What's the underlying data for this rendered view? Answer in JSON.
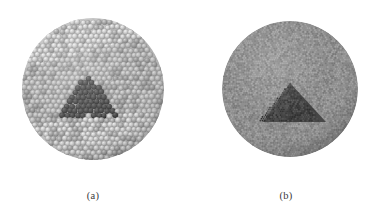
{
  "figure": {
    "type": "scientific-illustration",
    "background_color": "#ffffff",
    "panels": [
      {
        "id": "a",
        "caption": "(a)",
        "render_style": "coarse-spheres",
        "circle": {
          "cx": 93,
          "cy": 89,
          "r": 71
        },
        "matrix_particle": {
          "label": "matrix-sphere",
          "diameter_px": 5.6,
          "base_color": "#b4b4b4",
          "highlight_color": "#e6e6e6",
          "shadow_color": "#7d7d7d"
        },
        "shaded_band": {
          "label": "upper-right-shaded-band",
          "color": "#9a9a9a"
        },
        "inclusion": {
          "label": "dark-pyramid-cluster",
          "shape": "pyramid",
          "base_color": "#4a4a4a",
          "highlight_color": "#6e6e6e",
          "shadow_color": "#2e2e2e",
          "apex": {
            "x": 88,
            "y": 73
          },
          "base_left": {
            "x": 62,
            "y": 116
          },
          "base_right": {
            "x": 119,
            "y": 116
          }
        }
      },
      {
        "id": "b",
        "caption": "(b)",
        "render_style": "fine-particles",
        "circle": {
          "cx": 290,
          "cy": 89,
          "r": 68
        },
        "matrix_particle": {
          "label": "matrix-particle",
          "diameter_px": 2.1,
          "base_color": "#8c8c8c",
          "highlight_color": "#a8a8a8",
          "shadow_color": "#6f6f6f"
        },
        "inclusion": {
          "label": "dark-pyramid",
          "shape": "pyramid",
          "base_color": "#3f3f3f",
          "highlight_color": "#575757",
          "shadow_color": "#262626",
          "apex": {
            "x": 290,
            "y": 83
          },
          "base_left": {
            "x": 263,
            "y": 122
          },
          "base_right": {
            "x": 326,
            "y": 122
          }
        }
      }
    ]
  },
  "colors": {
    "page_background": "#ffffff",
    "caption_text": "#3a3a3a"
  }
}
